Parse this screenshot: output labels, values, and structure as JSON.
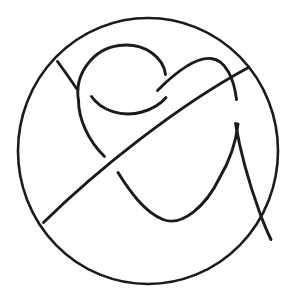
{
  "figure": {
    "kind": "line-drawing",
    "background_color": "#ffffff",
    "ink_color": "#1b1b1b",
    "canvas": {
      "width": 303,
      "height": 298
    }
  },
  "geometry": {
    "enclosing_circle": {
      "name": "enclosing-circle",
      "center_x": 148,
      "center_y": 151,
      "radius_x": 130,
      "radius_y": 133,
      "stroke_width": 2.6
    },
    "stroke_width_main": 2.9,
    "strands": [
      {
        "name": "upper-left-stub",
        "label": "short diagonal stub from circle rim toward first crossing",
        "d": "M 57.5 61.5 C 63 69 69.5 78 76.5 88.5"
      },
      {
        "name": "top-loop-arc",
        "label": "large upper loop arc, open at right where strand passes under",
        "d": "M 78.5 100.5 C 74 74 93 49 119 45.5 C 145 42 163.5 58 165.5 74.5"
      },
      {
        "name": "left-descending-curve",
        "label": "left side of loop descending to lower crossing",
        "d": "M 78.5 100.5 C 78.5 118 87.5 140 104.5 156.5"
      },
      {
        "name": "inner-lower-arc",
        "label": "inner cup arc beneath the top loop",
        "d": "M 91.5 96.5 C 101 110.5 122 117.5 142 112 C 153.5 108.8 161.5 103 166 97.5"
      },
      {
        "name": "long-diagonal",
        "label": "long straight diagonal from lower-left rim to upper-right rim passing over crossings",
        "d": "M 43.5 222.5 C 95 172 176 106.5 248.5 67.5"
      },
      {
        "name": "right-arch",
        "label": "right arch rising from the diagonal region over to the right descending strand",
        "d": "M 157.5 90.5 C 178 70 196 57 211 58.5 C 226 60 234 79 236.5 99.5"
      },
      {
        "name": "v-bottom-curve",
        "label": "deep V shaped curve at the bottom centre",
        "d": "M 118 172.5 C 129 190 144 212 163 219.5 C 182 227 206 206 219.5 178"
      },
      {
        "name": "right-descending-strand",
        "label": "strand descending from upper right down to the bottom-right rim",
        "d": "M 235.5 123.5 C 240 150 249 183 259.5 212 C 265 227 269 235.5 271 239.5"
      },
      {
        "name": "bottom-right-tail",
        "label": "tail continuing from the V curve to the circle rim at lower right",
        "d": "M 219.5 178 C 229 162 236 142 238 124"
      }
    ]
  },
  "colors": {
    "ink": "#1b1b1b",
    "paper": "#ffffff"
  }
}
